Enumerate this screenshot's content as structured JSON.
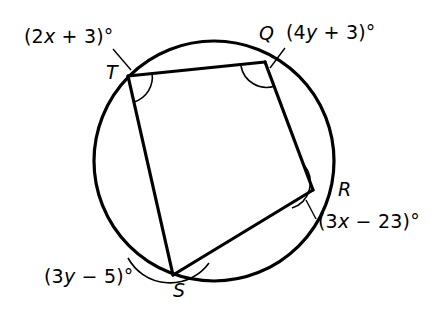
{
  "figure": {
    "type": "circle-inscribed-quadrilateral",
    "stroke_color": "#000000",
    "background_color": "#ffffff",
    "circle": {
      "cx": 214,
      "cy": 161,
      "r": 120,
      "stroke_width": 3
    },
    "vertices": [
      {
        "id": "T",
        "label": "T",
        "x": 128,
        "y": 76,
        "angle_label": "(2x + 3)°"
      },
      {
        "id": "Q",
        "label": "Q",
        "x": 265,
        "y": 62,
        "angle_label": "(4y + 3)°"
      },
      {
        "id": "R",
        "label": "R",
        "x": 313,
        "y": 190,
        "angle_label": "(3x − 23)°"
      },
      {
        "id": "S",
        "label": "S",
        "x": 173,
        "y": 275,
        "angle_label": "(3y − 5)°"
      }
    ],
    "sides": [
      {
        "from": "T",
        "to": "Q"
      },
      {
        "from": "Q",
        "to": "R"
      },
      {
        "from": "R",
        "to": "S"
      },
      {
        "from": "S",
        "to": "T"
      }
    ]
  },
  "labels": {
    "angle_T": {
      "prefix": "(2",
      "var": "x",
      "suffix": " + 3)°"
    },
    "angle_Q": {
      "prefix": "(4",
      "var": "y",
      "suffix": " + 3)°"
    },
    "angle_R": {
      "prefix": "(3",
      "var": "x",
      "suffix": " − 23)°"
    },
    "angle_S": {
      "prefix": "(3",
      "var": "y",
      "suffix": " − 5)°"
    },
    "point_T": "T",
    "point_Q": "Q",
    "point_R": "R",
    "point_S": "S"
  }
}
